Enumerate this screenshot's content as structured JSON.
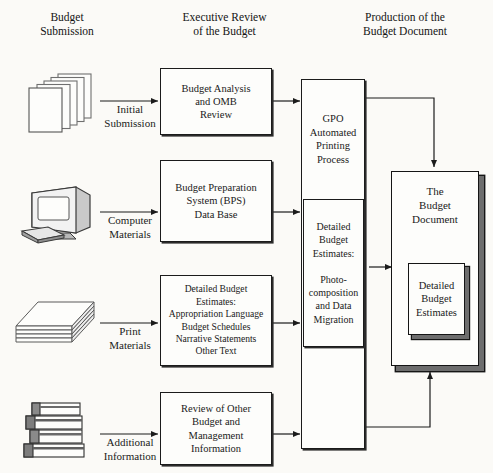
{
  "diagram": {
    "columns": [
      {
        "id": "col-budget-submission",
        "label": "Budget\nSubmission"
      },
      {
        "id": "col-executive-review",
        "label": "Executive Review\nof the Budget"
      },
      {
        "id": "col-production",
        "label": "Production of the\nBudget Document"
      }
    ],
    "inputs": [
      {
        "id": "input-initial-submission",
        "icon": "stacked-sheets-icon",
        "arrow_label": "Initial\nSubmission"
      },
      {
        "id": "input-computer-materials",
        "icon": "desktop-computer-icon",
        "arrow_label": "Computer\nMaterials"
      },
      {
        "id": "input-print-materials",
        "icon": "paper-ream-icon",
        "arrow_label": "Print\nMaterials"
      },
      {
        "id": "input-additional-information",
        "icon": "book-stack-icon",
        "arrow_label": "Additional\nInformation"
      }
    ],
    "process_boxes": [
      {
        "id": "box-budget-analysis",
        "label": "Budget Analysis\nand OMB\nReview"
      },
      {
        "id": "box-budget-preparation",
        "label": "Budget Preparation\nSystem (BPS)\nData Base"
      },
      {
        "id": "box-detailed-budget-estimates",
        "label": "Detailed Budget\nEstimates:\nAppropriation Language\nBudget Schedules\nNarrative Statements\nOther Text"
      },
      {
        "id": "box-review-of-other",
        "label": "Review of Other\nBudget and\nManagement\nInformation"
      }
    ],
    "gpo": {
      "id": "box-gpo-automated-printing",
      "label": "GPO\nAutomated\nPrinting\nProcess",
      "inner": {
        "id": "box-photocomposition",
        "label": "Detailed\nBudget\nEstimates:\n\nPhoto-\ncomposition\nand Data\nMigration"
      }
    },
    "output": {
      "id": "doc-budget-document",
      "label": "The\nBudget\nDocument",
      "inner": {
        "id": "doc-detailed-budget-estimates",
        "label": "Detailed\nBudget\nEstimates"
      }
    },
    "colors": {
      "background": "#fbfaf7",
      "ink": "#1b1b1b",
      "shadow": "#6d6d6d",
      "paper": "#fdfdfb"
    }
  }
}
